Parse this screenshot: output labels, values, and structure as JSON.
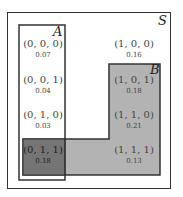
{
  "diagram": {
    "type": "venn",
    "sets": [
      {
        "name": "S",
        "label": "S"
      },
      {
        "name": "A",
        "label": "A"
      },
      {
        "name": "B",
        "label": "B"
      }
    ],
    "cells": [
      {
        "tuple": "(0, 0, 0)",
        "prob": "0.07"
      },
      {
        "tuple": "(1, 0, 0)",
        "prob": "0.16"
      },
      {
        "tuple": "(0, 0, 1)",
        "prob": "0.04"
      },
      {
        "tuple": "(1, 0, 1)",
        "prob": "0.18"
      },
      {
        "tuple": "(0, 1, 0)",
        "prob": "0.03"
      },
      {
        "tuple": "(1, 1, 0)",
        "prob": "0.21"
      },
      {
        "tuple": "(0, 1, 1)",
        "prob": "0.18"
      },
      {
        "tuple": "(1, 1, 1)",
        "prob": "0.13"
      }
    ],
    "colors": {
      "border": "#333333",
      "B_fill": "#b3b3b3",
      "overlap_fill": "#737373",
      "background": "#ffffff"
    }
  }
}
